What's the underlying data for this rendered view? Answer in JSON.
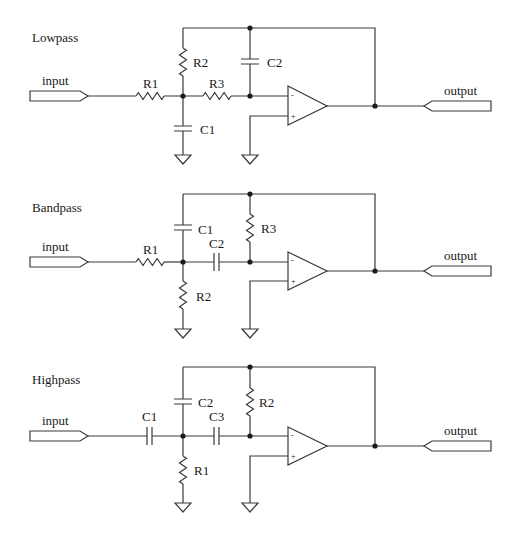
{
  "circuits": [
    {
      "id": "lowpass",
      "title": "Lowpass",
      "input_label": "input",
      "output_label": "output",
      "components": {
        "R1": "R1",
        "R2": "R2",
        "R3": "R3",
        "C1": "C1",
        "C2": "C2"
      },
      "opamp": {
        "minus": "-",
        "plus": "+"
      }
    },
    {
      "id": "bandpass",
      "title": "Bandpass",
      "input_label": "input",
      "output_label": "output",
      "components": {
        "R1": "R1",
        "R2": "R2",
        "R3": "R3",
        "C1": "C1",
        "C2": "C2"
      },
      "opamp": {
        "minus": "-",
        "plus": "+"
      }
    },
    {
      "id": "highpass",
      "title": "Highpass",
      "input_label": "input",
      "output_label": "output",
      "components": {
        "C1": "C1",
        "C2": "C2",
        "C3": "C3",
        "R1": "R1",
        "R2": "R2"
      },
      "opamp": {
        "minus": "-",
        "plus": "+"
      }
    }
  ]
}
